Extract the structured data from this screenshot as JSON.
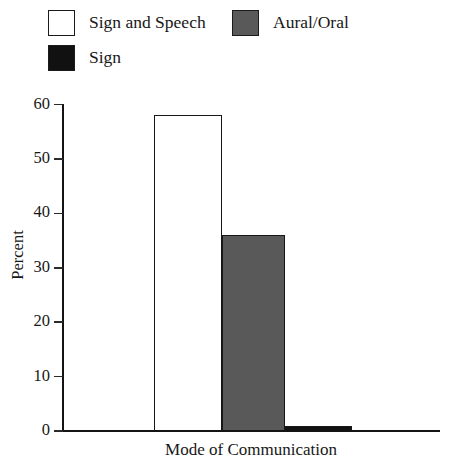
{
  "chart_data": {
    "type": "bar",
    "title": "",
    "subtitle": "",
    "xlabel": "Mode of Communication",
    "ylabel": "Percent",
    "categories": [
      "Sign and Speech",
      "Aural/Oral",
      "Sign"
    ],
    "values": [
      58,
      36,
      1
    ],
    "ylim": [
      0,
      60
    ],
    "yticks": [
      0,
      10,
      20,
      30,
      40,
      50,
      60
    ],
    "ytick_labels": [
      "0",
      "10",
      "20",
      "30",
      "40",
      "50",
      "60"
    ],
    "xticks": [],
    "xtick_labels": [],
    "grid": false,
    "legend_position": "top-left",
    "series": [
      {
        "name": "Sign and Speech",
        "value": 58,
        "color": "#ffffff"
      },
      {
        "name": "Aural/Oral",
        "value": 36,
        "color": "#595959"
      },
      {
        "name": "Sign",
        "value": 1,
        "color": "#111111"
      }
    ]
  },
  "legend": {
    "items": [
      {
        "label": "Sign and Speech",
        "color": "#ffffff"
      },
      {
        "label": "Aural/Oral",
        "color": "#595959"
      },
      {
        "label": "Sign",
        "color": "#111111"
      }
    ]
  },
  "colors": {
    "axis": "#141414",
    "text": "#171717",
    "bar_sign_and_speech": "#ffffff",
    "bar_aural_oral": "#595959",
    "bar_sign": "#111111",
    "background": "#ffffff"
  }
}
